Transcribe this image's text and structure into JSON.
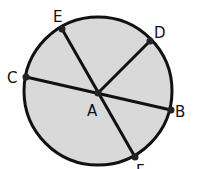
{
  "diagram": {
    "title": "",
    "circle": {
      "cx": 98,
      "cy": 91,
      "r": 74,
      "fill": "#d9d9d9",
      "stroke": "#111111"
    },
    "center": {
      "label": "A",
      "x": 98,
      "y": 93
    },
    "points": {
      "B": {
        "label": "B",
        "x": 171,
        "y": 110
      },
      "C": {
        "label": "C",
        "x": 26,
        "y": 77
      },
      "D": {
        "label": "D",
        "x": 150,
        "y": 41
      },
      "E": {
        "label": "E",
        "x": 62,
        "y": 29
      },
      "F": {
        "label": "F",
        "x": 135,
        "y": 157
      }
    },
    "segments": [
      "CB",
      "EF",
      "AD"
    ]
  }
}
